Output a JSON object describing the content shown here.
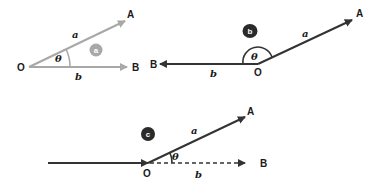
{
  "colors": {
    "diagram_a_stroke": "#a8a8a8",
    "diagram_b_stroke": "#3a3a3a",
    "diagram_c_stroke": "#2f2f2f",
    "badge_a_fill": "#a8a8a8",
    "badge_dark_fill": "#2a2a2a",
    "text": "#1a1a1a"
  },
  "diagrams": [
    {
      "id": "a",
      "badge": "a",
      "origin_label": "O",
      "point_a_label": "A",
      "point_b_label": "B",
      "vector_a_label": "a",
      "vector_b_label": "b",
      "angle_label": "θ",
      "description": "acute angle between vectors a and b"
    },
    {
      "id": "b",
      "badge": "b",
      "origin_label": "O",
      "point_a_label": "A",
      "point_b_label": "B",
      "vector_a_label": "a",
      "vector_b_label": "b",
      "angle_label": "θ",
      "description": "obtuse angle between vectors a and b"
    },
    {
      "id": "c",
      "badge": "c",
      "origin_label": "O",
      "point_a_label": "A",
      "point_b_label": "B",
      "vector_a_label": "a",
      "vector_b_label": "b",
      "angle_label": "θ",
      "description": "angle between vector a and extension of incoming vector b (dashed)"
    }
  ]
}
